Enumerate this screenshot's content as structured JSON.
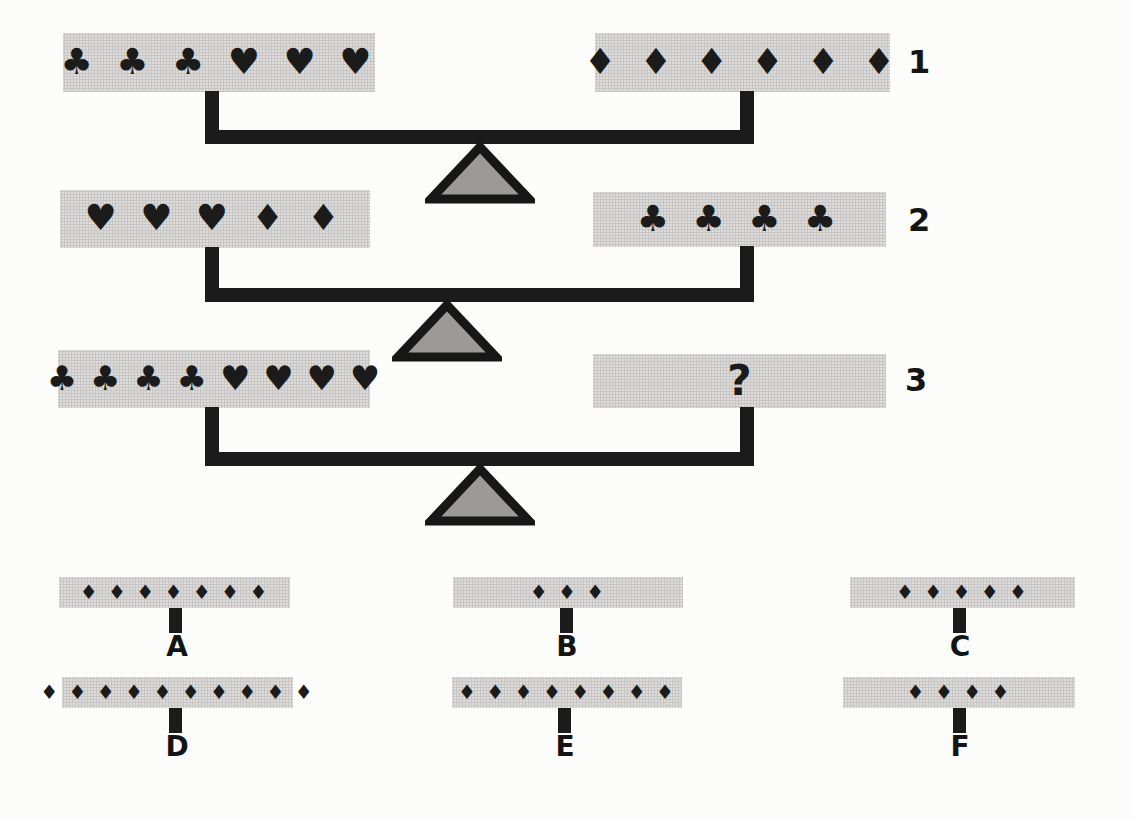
{
  "colors": {
    "paper": "#fcfcfa",
    "panel_gray": "#d6d5d3",
    "ink": "#1b1b1b",
    "fulcrum_fill": "#9b9a98"
  },
  "icons": {
    "club": "♣",
    "heart": "♥",
    "diamond": "♦",
    "question_mark": "?"
  },
  "puzzle": {
    "scales": [
      {
        "label": "1",
        "left": {
          "symbols": "♣ ♣ ♣ ♥ ♥ ♥",
          "clubs": 3,
          "hearts": 3,
          "diamonds": 0
        },
        "right": {
          "symbols": "♦ ♦ ♦ ♦ ♦ ♦",
          "clubs": 0,
          "hearts": 0,
          "diamonds": 6
        }
      },
      {
        "label": "2",
        "left": {
          "symbols": "♥ ♥ ♥ ♦ ♦",
          "clubs": 0,
          "hearts": 3,
          "diamonds": 2
        },
        "right": {
          "symbols": "♣ ♣ ♣ ♣",
          "clubs": 4,
          "hearts": 0,
          "diamonds": 0
        }
      },
      {
        "label": "3",
        "left": {
          "symbols": "♣ ♣ ♣ ♣ ♥ ♥ ♥ ♥",
          "clubs": 4,
          "hearts": 4,
          "diamonds": 0
        },
        "right": {
          "symbols": "?"
        }
      }
    ],
    "options": [
      {
        "letter": "A",
        "symbols": "♦ ♦ ♦ ♦ ♦ ♦ ♦",
        "diamonds": 7
      },
      {
        "letter": "B",
        "symbols": "♦ ♦ ♦",
        "diamonds": 3
      },
      {
        "letter": "C",
        "symbols": "♦ ♦ ♦ ♦ ♦",
        "diamonds": 5
      },
      {
        "letter": "D",
        "symbols": "♦ ♦ ♦ ♦ ♦ ♦ ♦ ♦ ♦ ♦",
        "diamonds": 10
      },
      {
        "letter": "E",
        "symbols": "♦ ♦ ♦ ♦ ♦ ♦ ♦ ♦",
        "diamonds": 8
      },
      {
        "letter": "F",
        "symbols": "♦ ♦ ♦ ♦",
        "diamonds": 4
      }
    ]
  }
}
